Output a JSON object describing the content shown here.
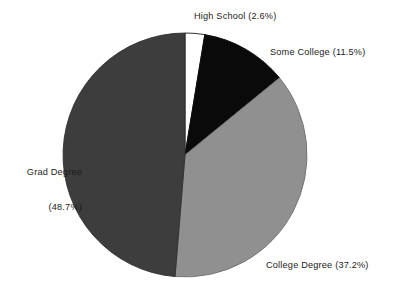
{
  "chart_data": {
    "type": "pie",
    "title": "",
    "subtitle": "",
    "xlabel": "",
    "ylabel": "",
    "legend_position": "none",
    "grid": false,
    "label_format": "{name} ({value}%)",
    "start_angle_deg": 0,
    "direction": "clockwise",
    "categories": [
      "High School",
      "Some College",
      "College Degree",
      "Grad Degree"
    ],
    "values": [
      2.6,
      11.5,
      37.2,
      48.7
    ],
    "units": "percent",
    "slices": [
      {
        "name": "High School",
        "value": 2.6,
        "label": "High School (2.6%)",
        "color": "#ffffff",
        "stroke": "#1a1a1a"
      },
      {
        "name": "Some College",
        "value": 11.5,
        "label": "Some College (11.5%)",
        "color": "#0a0a0a",
        "stroke": "#0a0a0a"
      },
      {
        "name": "College Degree",
        "value": 37.2,
        "label": "College Degree (37.2%)",
        "color": "#909090",
        "stroke": "#6f6f6f"
      },
      {
        "name": "Grad Degree",
        "value": 48.7,
        "label_line1": "Grad Degree",
        "label_line2": "(48.7%)",
        "label": "Grad Degree (48.7%)",
        "color": "#3d3d3d",
        "stroke": "#2e2e2e"
      }
    ],
    "geometry": {
      "center_x": 185,
      "center_y": 155,
      "radius": 122
    },
    "background_color": "#ffffff",
    "text_color": "#1c1c1c"
  }
}
